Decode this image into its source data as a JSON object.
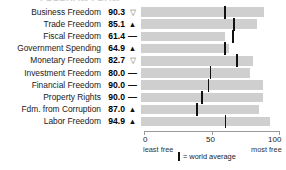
{
  "chart_data": {
    "type": "bar",
    "title": "",
    "xlabel": "",
    "ylabel": "",
    "xlim": [
      0,
      100
    ],
    "grid": false,
    "orientation": "horizontal",
    "categories": [
      "Business Freedom",
      "Trade Freedom",
      "Fiscal Freedom",
      "Government Spending",
      "Monetary Freedom",
      "Investment Freedom",
      "Financial Freedom",
      "Property Rights",
      "Fdm. from Corruption",
      "Labor Freedom"
    ],
    "values": [
      90.3,
      85.1,
      61.4,
      64.9,
      82.7,
      80.0,
      90.0,
      90.0,
      87.0,
      94.9
    ],
    "value_labels": [
      "90.3",
      "85.1",
      "61.4",
      "64.9",
      "82.7",
      "80.0",
      "90.0",
      "90.0",
      "87.0",
      "94.9"
    ],
    "trends": [
      "down",
      "up",
      "flat",
      "up",
      "down",
      "flat",
      "flat",
      "flat",
      "up",
      "up"
    ],
    "trend_glyphs": [
      "▽",
      "▲",
      "—",
      "▲",
      "▽",
      "—",
      "—",
      "—",
      "▲",
      "▲"
    ],
    "world_average": [
      61.0,
      68.0,
      67.0,
      61.0,
      70.0,
      50.5,
      49.0,
      44.0,
      40.5,
      61.5
    ],
    "series": [
      {
        "name": "score",
        "values": [
          90.3,
          85.1,
          61.4,
          64.9,
          82.7,
          80.0,
          90.0,
          90.0,
          87.0,
          94.9
        ]
      },
      {
        "name": "world average",
        "values": [
          61.0,
          68.0,
          67.0,
          61.0,
          70.0,
          50.5,
          49.0,
          44.0,
          40.5,
          61.5
        ]
      }
    ],
    "axis": {
      "ticks": [
        0,
        50,
        100
      ],
      "tick_labels": [
        "0",
        "50",
        "100"
      ],
      "left_caption": "least free",
      "right_caption": "most free"
    },
    "legend": {
      "position": "bottom",
      "entries": [
        {
          "marker": "tick",
          "label": "= world average"
        }
      ]
    },
    "colors": {
      "bar": "#cfcfcf",
      "average_tick": "#111111",
      "axis": "#9a9a9a",
      "text": "#1a1a1a"
    }
  },
  "title_remnant": "FREEDOM FROM"
}
